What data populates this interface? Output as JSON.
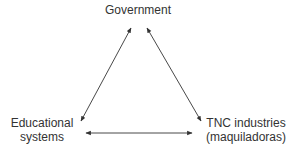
{
  "diagram": {
    "type": "triangle-relationship",
    "nodes": [
      {
        "id": "government",
        "lines": [
          "Government"
        ]
      },
      {
        "id": "educational-systems",
        "lines": [
          "Educational",
          "systems"
        ]
      },
      {
        "id": "tnc-industries",
        "lines": [
          "TNC industries",
          "(maquiladoras)"
        ]
      }
    ],
    "edges": [
      {
        "from": "government",
        "to": "educational-systems",
        "direction": "bidirectional"
      },
      {
        "from": "government",
        "to": "tnc-industries",
        "direction": "bidirectional"
      },
      {
        "from": "educational-systems",
        "to": "tnc-industries",
        "direction": "bidirectional"
      }
    ],
    "colors": {
      "line": "#333333",
      "text": "#333333",
      "background": "#ffffff"
    }
  }
}
